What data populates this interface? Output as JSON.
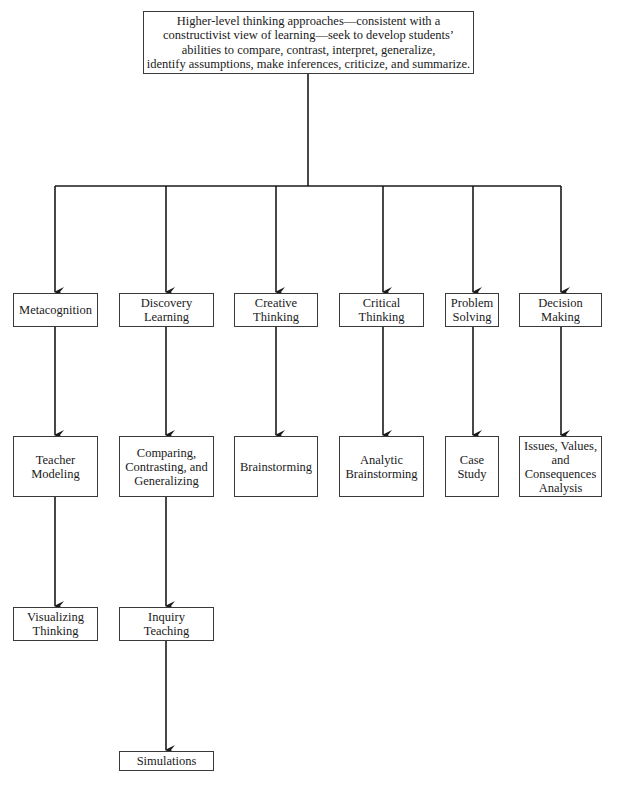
{
  "diagram": {
    "type": "hierarchy",
    "root": {
      "id": "root",
      "label": "Higher-level thinking approaches—consistent with a\nconstructivist view of learning—seek to develop students’\nabilities to compare, contrast, interpret, generalize,\nidentify assumptions, make inferences, criticize, and summarize."
    },
    "approaches": [
      {
        "id": "metacognition",
        "label": "Metacognition",
        "children": [
          {
            "id": "teacher-modeling",
            "label": "Teacher\nModeling",
            "children": [
              {
                "id": "visualizing-thinking",
                "label": "Visualizing\nThinking"
              }
            ]
          }
        ]
      },
      {
        "id": "discovery-learning",
        "label": "Discovery\nLearning",
        "children": [
          {
            "id": "comparing",
            "label": "Comparing,\nContrasting, and\nGeneralizing",
            "children": [
              {
                "id": "inquiry-teaching",
                "label": "Inquiry\nTeaching",
                "children": [
                  {
                    "id": "simulations",
                    "label": "Simulations"
                  }
                ]
              }
            ]
          }
        ]
      },
      {
        "id": "creative-thinking",
        "label": "Creative\nThinking",
        "children": [
          {
            "id": "brainstorming",
            "label": "Brainstorming"
          }
        ]
      },
      {
        "id": "critical-thinking",
        "label": "Critical\nThinking",
        "children": [
          {
            "id": "analytic-brainstorming",
            "label": "Analytic\nBrainstorming"
          }
        ]
      },
      {
        "id": "problem-solving",
        "label": "Problem\nSolving",
        "children": [
          {
            "id": "case-study",
            "label": "Case\nStudy"
          }
        ]
      },
      {
        "id": "decision-making",
        "label": "Decision\nMaking",
        "children": [
          {
            "id": "issues-values",
            "label": "Issues, Values,\nand\nConsequences\nAnalysis"
          }
        ]
      }
    ]
  },
  "labels": {
    "root": "Higher-level thinking approaches—consistent with a\nconstructivist view of learning—seek to develop students’\nabilities to compare, contrast, interpret, generalize,\nidentify assumptions, make inferences, criticize, and summarize.",
    "metacognition": "Metacognition",
    "discovery": "Discovery\nLearning",
    "creative": "Creative\nThinking",
    "critical": "Critical\nThinking",
    "problem": "Problem\nSolving",
    "decision": "Decision\nMaking",
    "teacher_modeling": "Teacher\nModeling",
    "comparing": "Comparing,\nContrasting, and\nGeneralizing",
    "brainstorming": "Brainstorming",
    "analytic": "Analytic\nBrainstorming",
    "case_study": "Case\nStudy",
    "issues": "Issues, Values,\nand\nConsequences\nAnalysis",
    "visualizing": "Visualizing\nThinking",
    "inquiry": "Inquiry\nTeaching",
    "simulations": "Simulations"
  },
  "colors": {
    "line": "#1a1a1a",
    "border": "#3a3a3a",
    "background": "#ffffff"
  }
}
